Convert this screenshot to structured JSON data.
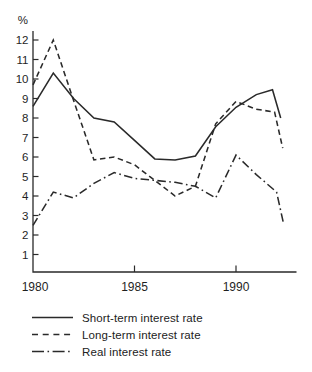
{
  "chart_data": {
    "type": "line",
    "title": "",
    "ylabel": "%",
    "xlabel": "",
    "grid": false,
    "line_color": "#2a2a2a",
    "x_range": [
      1980,
      1993
    ],
    "y_range": [
      0,
      12.6
    ],
    "x_ticks": [
      1980,
      1985,
      1990
    ],
    "y_ticks": [
      1,
      2,
      3,
      4,
      5,
      6,
      7,
      8,
      9,
      10,
      11,
      12
    ],
    "series": [
      {
        "name": "Short-term interest rate",
        "style": "solid",
        "x": [
          1980,
          1981,
          1982,
          1983,
          1984,
          1985,
          1986,
          1987,
          1988,
          1989,
          1990,
          1991,
          1991.8,
          1992.2
        ],
        "values": [
          8.6,
          10.3,
          9.0,
          8.0,
          7.8,
          6.85,
          5.9,
          5.85,
          6.05,
          7.55,
          8.55,
          9.2,
          9.45,
          8.0
        ]
      },
      {
        "name": "Long-term interest rate",
        "style": "dashed",
        "x": [
          1980,
          1981,
          1982,
          1983,
          1984,
          1985,
          1986,
          1987,
          1988,
          1989,
          1990,
          1991,
          1991.9,
          1992.3
        ],
        "values": [
          9.7,
          12.0,
          8.9,
          5.85,
          6.0,
          5.6,
          4.8,
          4.0,
          4.5,
          7.7,
          8.85,
          8.45,
          8.3,
          6.45
        ]
      },
      {
        "name": "Real interest rate",
        "style": "dashdot",
        "x": [
          1980,
          1981,
          1982,
          1983,
          1984,
          1985,
          1986,
          1987,
          1988,
          1989,
          1990,
          1991,
          1992,
          1992.35
        ],
        "values": [
          2.5,
          4.2,
          3.9,
          4.65,
          5.2,
          4.9,
          4.8,
          4.7,
          4.5,
          3.9,
          6.1,
          5.1,
          4.2,
          2.55
        ]
      }
    ],
    "legend_position": "bottom-left",
    "legend": [
      {
        "label": "Short-term interest rate",
        "style": "solid"
      },
      {
        "label": "Long-term interest rate",
        "style": "dashed"
      },
      {
        "label": "Real interest rate",
        "style": "dashdot"
      }
    ]
  }
}
